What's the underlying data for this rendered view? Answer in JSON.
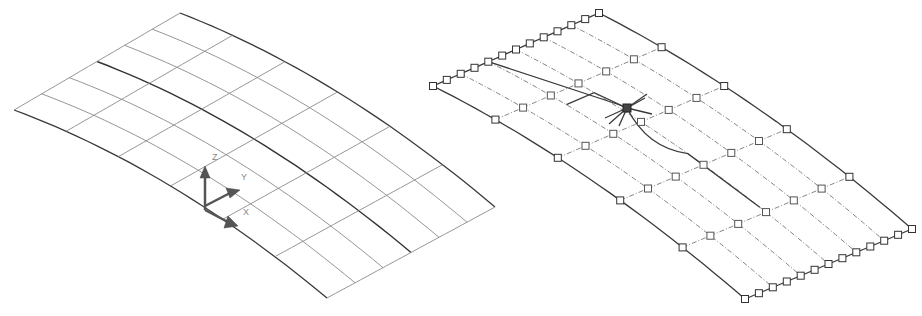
{
  "figure": {
    "left_surface": {
      "name": "surface-isolines",
      "u_divisions": 6,
      "v_divisions": 6
    },
    "right_surface": {
      "name": "surface-control-vertices",
      "u_divisions": 6,
      "v_divisions": 5,
      "selected_vertex": "grip"
    },
    "ucs_icon": {
      "axis_labels": {
        "z": "Z",
        "y": "Y",
        "x": "X"
      }
    }
  }
}
